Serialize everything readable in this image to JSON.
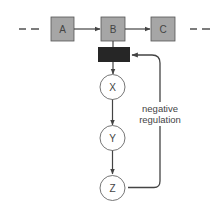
{
  "diagram": {
    "pathway": [
      {
        "id": "A",
        "label": "A"
      },
      {
        "id": "B",
        "label": "B"
      },
      {
        "id": "C",
        "label": "C"
      }
    ],
    "branch": [
      {
        "id": "X",
        "label": "X"
      },
      {
        "id": "Y",
        "label": "Y"
      },
      {
        "id": "Z",
        "label": "Z"
      }
    ],
    "feedback": {
      "line1": "negative",
      "line2": "regulation"
    },
    "colors": {
      "box_fill": "#a6a6a6",
      "box_stroke": "#555555",
      "bar_fill": "#262626",
      "line": "#444444",
      "circle_fill": "#ffffff"
    }
  }
}
